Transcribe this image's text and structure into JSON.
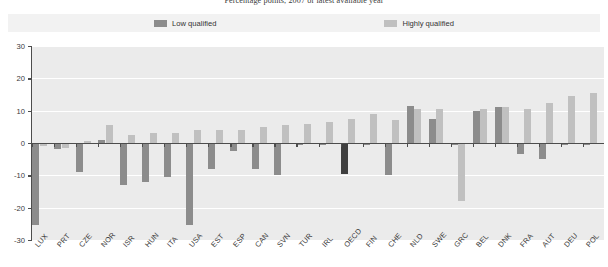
{
  "chart_data": {
    "type": "bar",
    "title": "Percentage points, 2007 or latest available year",
    "xlabel": "",
    "ylabel": "",
    "ylim": [
      -30,
      30
    ],
    "yticks": [
      30,
      20,
      10,
      0,
      -10,
      -20,
      -30
    ],
    "grid": true,
    "legend_position": "top-center",
    "categories": [
      "LUX",
      "PRT",
      "CZE",
      "NOR",
      "ISR",
      "HUN",
      "ITA",
      "USA",
      "EST",
      "ESP",
      "CAN",
      "SVN",
      "TUR",
      "IRL",
      "OECD",
      "FIN",
      "CHE",
      "NLD",
      "SWE",
      "GRC",
      "BEL",
      "DNK",
      "FRA",
      "AUT",
      "DEU",
      "POL"
    ],
    "series": [
      {
        "name": "Low qualified",
        "color": "#8c8c8c",
        "values": [
          -25.5,
          -2.0,
          -9.0,
          1.0,
          -13.0,
          -12.0,
          -10.5,
          -25.5,
          -8.0,
          -2.5,
          -8.0,
          -10.0,
          -0.5,
          -0.5,
          -9.5,
          -0.5,
          -10.0,
          11.5,
          7.5,
          -0.5,
          10.0,
          11.0,
          -3.5,
          -5.0,
          -0.5,
          -0.5
        ]
      },
      {
        "name": "Highly qualified",
        "color": "#c0c0c0",
        "values": [
          -1.0,
          -1.5,
          0.5,
          5.5,
          2.5,
          3.0,
          3.0,
          4.0,
          4.0,
          4.0,
          5.0,
          5.5,
          6.0,
          6.5,
          7.5,
          9.0,
          7.0,
          10.5,
          10.5,
          -18.0,
          10.5,
          11.0,
          10.5,
          12.5,
          14.5,
          15.5
        ]
      }
    ],
    "highlight_category": "OECD"
  },
  "legend": {
    "items": [
      {
        "label": "Low qualified",
        "swatch": "#8c8c8c"
      },
      {
        "label": "Highly qualified",
        "swatch": "#c0c0c0"
      }
    ]
  },
  "colors": {
    "plot_background": "#ebebeb",
    "legend_background": "#f2f2f2",
    "axis": "#4d4d4d",
    "gridline": "#ffffff",
    "low_qualified": "#8c8c8c",
    "highly_qualified": "#c0c0c0",
    "highlight": "#3f3f3f"
  }
}
